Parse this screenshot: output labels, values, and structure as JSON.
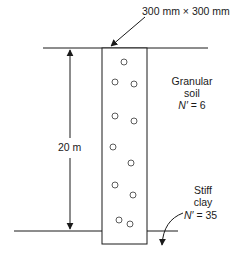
{
  "diagram": {
    "pile_size_label": "300 mm × 300 mm",
    "depth_label": "20 m",
    "upper_layer": {
      "line1": "Granular",
      "line2": "soil",
      "n_symbol": "N′",
      "n_value": "= 6"
    },
    "lower_layer": {
      "line1": "Stiff",
      "line2": "clay",
      "n_symbol": "N′",
      "n_value": "= 35"
    },
    "colors": {
      "line": "#1a1a1a",
      "background": "#ffffff"
    }
  }
}
